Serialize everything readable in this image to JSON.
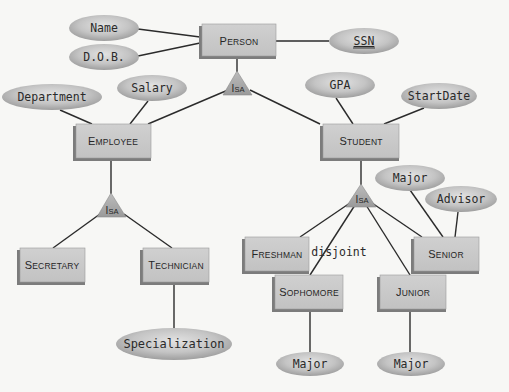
{
  "diagram": {
    "type": "ER diagram with ISA hierarchies",
    "colors": {
      "background": "#f7f7f5",
      "entity_fill": "#c9c9c9",
      "entity_shadow": "#7c7c7c",
      "attribute_fill": "#bdbdbd",
      "isa_fill": "#a9a9a9",
      "edge": "#2b2b2b"
    },
    "entities": {
      "person": {
        "label_cap": "P",
        "label_rest": "ERSON"
      },
      "employee": {
        "label_cap": "E",
        "label_rest": "MPLOYEE"
      },
      "student": {
        "label_cap": "S",
        "label_rest": "TUDENT"
      },
      "secretary": {
        "label_cap": "S",
        "label_rest": "ECRETARY"
      },
      "technician": {
        "label_cap": "T",
        "label_rest": "ECHNICIAN"
      },
      "freshman": {
        "label_cap": "F",
        "label_rest": "RESHMAN"
      },
      "senior": {
        "label_cap": "S",
        "label_rest": "ENIOR"
      },
      "sophomore": {
        "label_cap": "S",
        "label_rest": "OPHOMORE"
      },
      "junior": {
        "label_cap": "J",
        "label_rest": "UNIOR"
      }
    },
    "attributes": {
      "name": "Name",
      "dob": "D.O.B.",
      "ssn": "SSN",
      "department": "Department",
      "salary": "Salary",
      "gpa": "GPA",
      "start_date": "StartDate",
      "specialization": "Specialization",
      "senior_major": "Major",
      "senior_advisor": "Advisor",
      "sophomore_major": "Major",
      "junior_major": "Major"
    },
    "key_attribute": "SSN",
    "isa": {
      "cap": "I",
      "rest": "SA",
      "person_isa_label": "IsA",
      "employee_isa_label": "IsA",
      "student_isa_label": "IsA"
    },
    "constraints": {
      "student_isa": "disjoint"
    }
  }
}
